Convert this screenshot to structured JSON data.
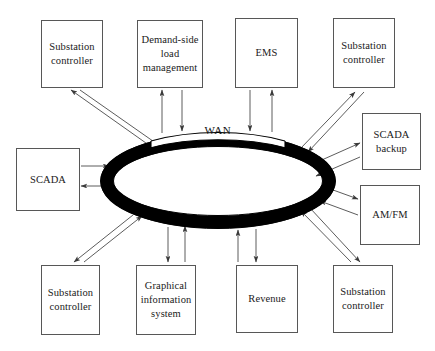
{
  "diagram": {
    "type": "network-ring-topology",
    "center": {
      "label": "WAN",
      "shape": "ellipse-ring",
      "ring_color": "#000000",
      "gap_color": "#ffffff"
    },
    "connection_style": "bidirectional-arrows",
    "nodes": [
      {
        "id": "substation-controller-top-left",
        "label": "Substation\ncontroller",
        "x": 41,
        "y": 20,
        "w": 62,
        "h": 68
      },
      {
        "id": "demand-side-load-management",
        "label": "Demand-side\nload\nmanagement",
        "x": 137,
        "y": 20,
        "w": 66,
        "h": 68
      },
      {
        "id": "ems",
        "label": "EMS",
        "x": 235,
        "y": 18,
        "w": 63,
        "h": 70
      },
      {
        "id": "substation-controller-top-right",
        "label": "Substation\ncontroller",
        "x": 333,
        "y": 18,
        "w": 62,
        "h": 70
      },
      {
        "id": "scada-backup",
        "label": "SCADA\nbackup",
        "x": 362,
        "y": 113,
        "w": 59,
        "h": 57
      },
      {
        "id": "am-fm",
        "label": "AM/FM",
        "x": 360,
        "y": 185,
        "w": 60,
        "h": 60
      },
      {
        "id": "substation-controller-bot-right",
        "label": "Substation\ncontroller",
        "x": 333,
        "y": 265,
        "w": 60,
        "h": 68
      },
      {
        "id": "revenue",
        "label": "Revenue",
        "x": 236,
        "y": 265,
        "w": 62,
        "h": 68
      },
      {
        "id": "graphical-information-system",
        "label": "Graphical\ninformation\nsystem",
        "x": 136,
        "y": 265,
        "w": 60,
        "h": 70
      },
      {
        "id": "substation-controller-bot-left",
        "label": "Substation\ncontroller",
        "x": 41,
        "y": 265,
        "w": 59,
        "h": 70
      },
      {
        "id": "scada",
        "label": "SCADA",
        "x": 16,
        "y": 148,
        "w": 64,
        "h": 63
      }
    ]
  }
}
